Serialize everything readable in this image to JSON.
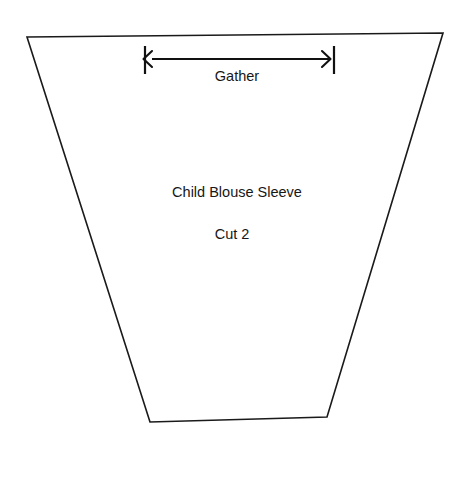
{
  "document": {
    "kind": "sewing-pattern-piece",
    "background_color": "#ffffff",
    "width": 465,
    "height": 477
  },
  "pattern": {
    "piece_name": "Child Blouse Sleeve",
    "cut_count": "Cut 2",
    "outline": {
      "shape": "trapezoid",
      "stroke_color": "#1a1a1a",
      "fill_color": "#ffffff",
      "points": "27,37 443,33 327,417 150,422"
    }
  },
  "gather_dimension": {
    "label": "Gather",
    "stroke_color": "#111111",
    "line_y": 59,
    "left_tick_x": 145,
    "right_tick_x": 334,
    "tick_top_y": 46,
    "tick_bottom_y": 74,
    "arrow_start_x": 152,
    "arrow_end_x": 330,
    "left_arrowhead": "152,51 143.5,59 152,67",
    "right_arrowhead": "322,51 330.5,59 322,67"
  }
}
